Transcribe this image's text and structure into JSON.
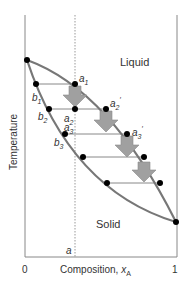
{
  "diagram": {
    "region_liquid": "Liquid",
    "region_solid": "Solid",
    "ylabel": "Temperature",
    "xlabel": "Composition, ",
    "xlabel_var": "x",
    "xlabel_sub": "A",
    "x_tick_0": "0",
    "x_tick_1": "1",
    "isopleth_label": "a",
    "points": {
      "a1": "a",
      "a1_sub": "1",
      "a2": "a",
      "a2_sub": "2",
      "a2p": "a",
      "a2p_sub": "2",
      "a3": "a",
      "a3_sub": "3",
      "a3p": "a",
      "a3p_sub": "3",
      "b1": "b",
      "b1_sub": "1",
      "b2": "b",
      "b2_sub": "2",
      "b3": "b",
      "b3_sub": "3"
    },
    "colors": {
      "curve": "#777777",
      "arrow_fill": "#a0a0a0",
      "axis": "#888888",
      "point": "#000000"
    }
  }
}
